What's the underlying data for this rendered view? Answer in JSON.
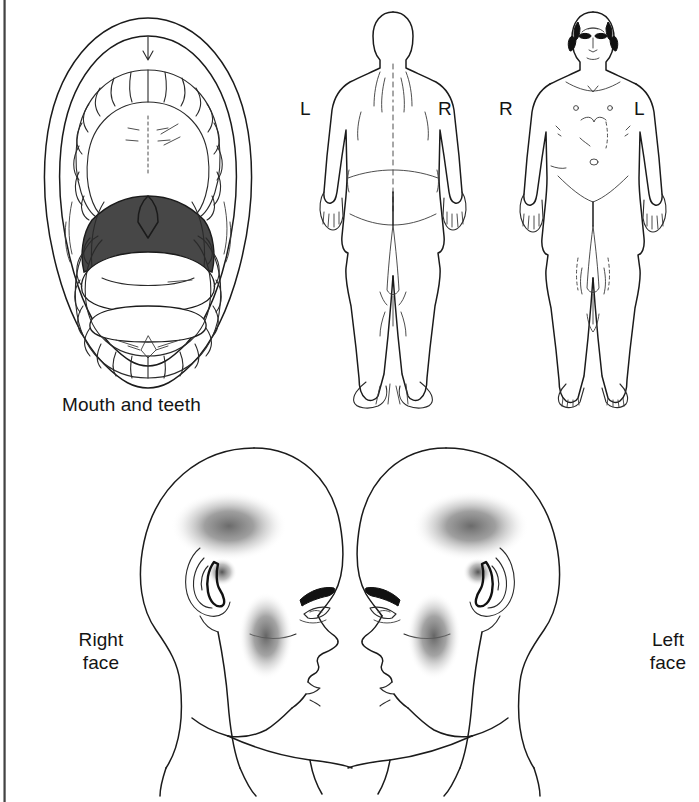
{
  "page": {
    "background_color": "#ffffff",
    "ink_color": "#1b1b1b",
    "shade_color": "#6a6a6a"
  },
  "panels": {
    "mouth": {
      "caption": "Mouth and teeth",
      "view": "open mouth, intraoral view",
      "features": [
        "lips outline",
        "upper dental arch",
        "hard palate with rugae",
        "soft palate and uvula",
        "oropharynx shaded dark",
        "tongue",
        "lower dental arch",
        "floor of mouth"
      ]
    },
    "body_back": {
      "view": "posterior",
      "label_left": "L",
      "label_right": "R"
    },
    "body_front": {
      "view": "anterior",
      "label_left": "R",
      "label_right": "L"
    },
    "face_right": {
      "caption": "Right\nface",
      "view": "right lateral profile facing right",
      "shaded_regions": [
        "temporal",
        "masseter/cheek",
        "preauricular"
      ]
    },
    "face_left": {
      "caption": "Left\nface",
      "view": "left lateral profile facing left",
      "shaded_regions": [
        "temporal",
        "masseter/cheek",
        "preauricular"
      ]
    }
  }
}
